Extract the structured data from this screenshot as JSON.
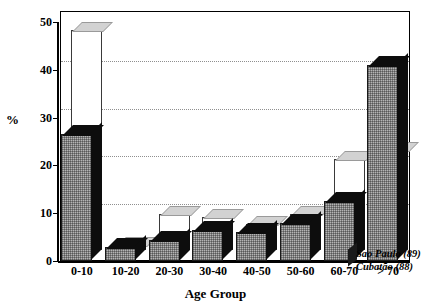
{
  "chart_data": {
    "type": "bar",
    "title": "",
    "subtitle": "",
    "xlabel": "Age Group",
    "ylabel": "%",
    "categories": [
      "0-10",
      "10-20",
      "20-30",
      "30-40",
      "40-50",
      "50-60",
      "60-70",
      "> 70"
    ],
    "series": [
      {
        "name": "Sao Paulo (89)",
        "style": "hatched-grey-3d-front",
        "values": [
          26.5,
          3.0,
          4.5,
          6.5,
          6.0,
          8.0,
          12.5,
          41.0
        ]
      },
      {
        "name": "Cubatão (88)",
        "style": "white-outline-3d-back",
        "values": [
          46.0,
          1.0,
          7.5,
          7.0,
          5.5,
          7.5,
          19.0,
          21.0
        ]
      }
    ],
    "ylim": [
      0,
      50
    ],
    "yticks": [
      0,
      10,
      20,
      30,
      40,
      50
    ],
    "ytick_labels": [
      "0",
      "10",
      "20",
      "30",
      "40",
      "50"
    ],
    "grid": "horizontal-dotted",
    "legend_position": "bottom-right",
    "legend_entries": [
      "Sao Paulo (89)",
      "Cubatão (88)"
    ]
  },
  "axis": {
    "y_label": "%",
    "x_title": "Age Group"
  },
  "legend": {
    "line1": "Sao Paulo (89)",
    "line2": "Cubatão (88)"
  }
}
